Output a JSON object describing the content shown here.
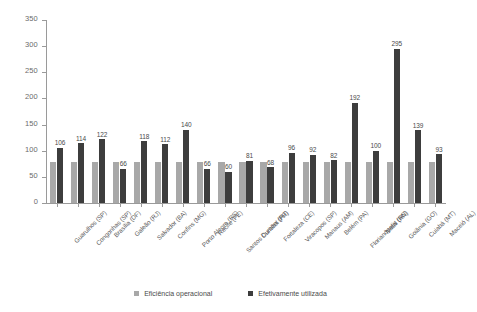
{
  "chart_data": {
    "type": "bar",
    "title": "",
    "xlabel": "",
    "ylabel": "",
    "ylim": [
      0,
      350
    ],
    "ytick_step": 50,
    "yticks": [
      0,
      50,
      100,
      150,
      200,
      250,
      300,
      350
    ],
    "grid": false,
    "legend_position": "bottom",
    "categories": [
      "Guarulhos (SP)",
      "Congonhas (SP)",
      "Brasília (DF)",
      "Galeão (RJ)",
      "Salvador (BA)",
      "Confins (MG)",
      "Porto Alegre (RS)",
      "Recife (PE)",
      "Santos Dumont (RJ)",
      "Curitiba (PR)",
      "Fortaleza (CE)",
      "Viracopos (SP)",
      "Manaus (AM)",
      "Belém (PA)",
      "Florianópolis (SC)",
      "Natal (RN)",
      "Goiânia (GO)",
      "Cuiabá (MT)",
      "Maceió (AL)"
    ],
    "series": [
      {
        "name": "Eficiência operacional",
        "color": "#a8a8a8",
        "values": [
          78,
          78,
          78,
          78,
          78,
          78,
          78,
          78,
          78,
          78,
          78,
          78,
          78,
          78,
          78,
          78,
          78,
          78,
          78
        ],
        "labels_shown": false
      },
      {
        "name": "Efetivamente utilizada",
        "color": "#3d3d3d",
        "values": [
          106,
          114,
          122,
          66,
          118,
          112,
          140,
          66,
          60,
          81,
          68,
          96,
          92,
          82,
          192,
          100,
          295,
          139,
          93
        ],
        "labels_shown": true
      }
    ]
  },
  "legend": {
    "items": [
      {
        "label": "Eficiência operacional",
        "swatch": "light-square-icon"
      },
      {
        "label": "Efetivamente utilizada",
        "swatch": "dark-square-icon"
      }
    ]
  },
  "colors": {
    "series_light": "#a8a8a8",
    "series_dark": "#3d3d3d",
    "axis": "#9a9a9a",
    "text": "#4a4a4a",
    "background": "#ffffff"
  }
}
